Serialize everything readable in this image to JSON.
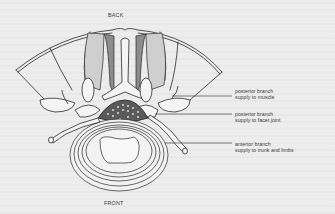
{
  "figure": {
    "type": "anatomical cross-section of vertebra with spinal nerve branches",
    "orientation_labels": {
      "top": "BACK",
      "bottom": "FRONT"
    },
    "callouts": [
      {
        "line1": "posterior branch",
        "line2": "supply to muscle"
      },
      {
        "line1": "posterior branch",
        "line2": "supply to facet joint"
      },
      {
        "line1": "anterior branch",
        "line2": "supply to trunk and limbs"
      }
    ]
  },
  "colors": {
    "background": "#ededed",
    "ink": "#2a2a2a"
  }
}
